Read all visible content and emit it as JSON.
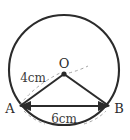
{
  "figure": {
    "kind": "circle-with-inscribed-triangle",
    "background_color": "#ffffff",
    "stroke_color": "#2b2b2b",
    "guide_color": "#9a9a9a",
    "circle": {
      "center_x": 64,
      "center_y": 70,
      "radius": 55
    },
    "points": {
      "center": {
        "label": "O",
        "x": 64,
        "y": 75
      },
      "left": {
        "label": "A",
        "x": 19,
        "y": 106
      },
      "right": {
        "label": "B",
        "x": 110,
        "y": 106
      }
    },
    "measures": {
      "radius_label": "4cm",
      "chord_label": "6cm"
    }
  }
}
